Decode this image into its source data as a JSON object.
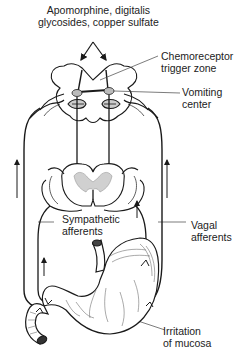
{
  "labels": {
    "emetics": {
      "line1": "Apomorphine, digitalis",
      "line2": "glycosides, copper sulfate"
    },
    "ctz": {
      "line1": "Chemoreceptor",
      "line2": "trigger zone"
    },
    "vomiting_center": {
      "line1": "Vomiting",
      "line2": "center"
    },
    "sympathetic": {
      "line1": "Sympathetic",
      "line2": "afferents"
    },
    "vagal": {
      "line1": "Vagal",
      "line2": "afferents"
    },
    "irritation": {
      "line1": "Irritation",
      "line2": "of mucosa"
    }
  },
  "colors": {
    "line": "#1a1a1a",
    "fill": "#ffffff",
    "stipple": "#c8c8c8"
  }
}
